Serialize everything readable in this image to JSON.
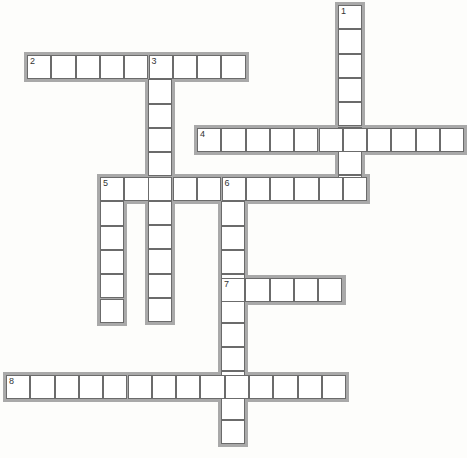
{
  "puzzle": {
    "type": "crossword",
    "cell_size": 24.3,
    "colors": {
      "frame": "#a9a9a9",
      "cell_border": "#6b6b6b",
      "cell_fill": "#ffffff",
      "background": "#fdfdfb"
    },
    "words": [
      {
        "number": "1",
        "direction": "down",
        "x": 338,
        "y": 5,
        "length": 8
      },
      {
        "number": "2",
        "direction": "across",
        "x": 27,
        "y": 55,
        "length": 9
      },
      {
        "number": "3",
        "direction": "down",
        "x": 148,
        "y": 55,
        "length": 11
      },
      {
        "number": "4",
        "direction": "across",
        "x": 197,
        "y": 128,
        "length": 11
      },
      {
        "number": "5",
        "direction": "across",
        "x": 100,
        "y": 177,
        "length": 11
      },
      {
        "number": "5",
        "direction": "down",
        "x": 100,
        "y": 177,
        "length": 6
      },
      {
        "number": "6",
        "direction": "down",
        "x": 221,
        "y": 177,
        "length": 11
      },
      {
        "number": "7",
        "direction": "across",
        "x": 221,
        "y": 278,
        "length": 5
      },
      {
        "number": "8",
        "direction": "across",
        "x": 6,
        "y": 375,
        "length": 14
      }
    ]
  }
}
